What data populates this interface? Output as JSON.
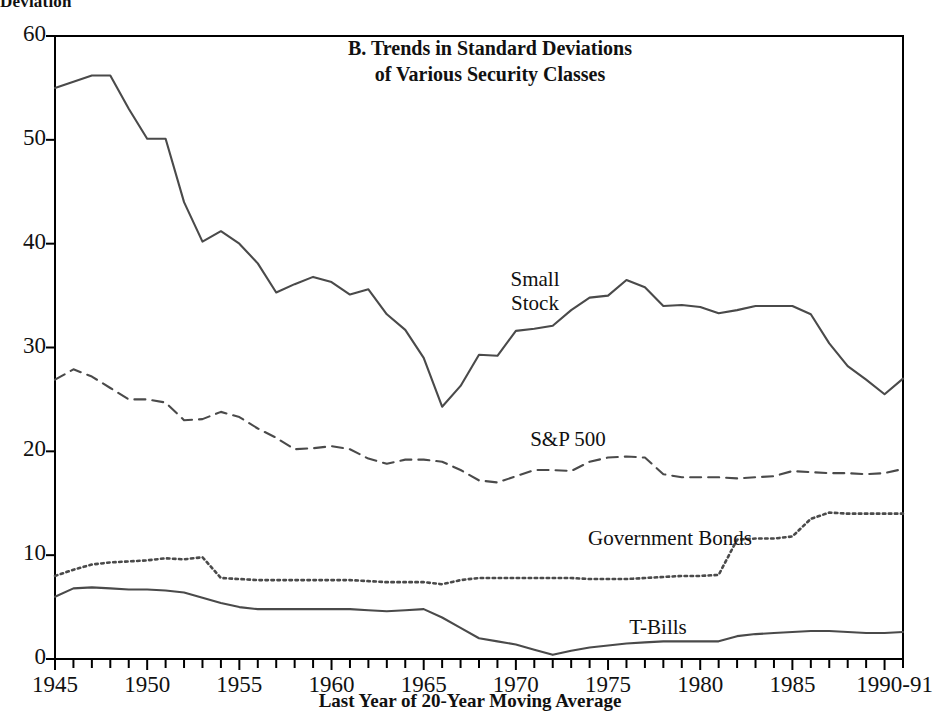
{
  "axis_title_top": "Deviation",
  "title_line1": "B. Trends in Standard Deviations",
  "title_line2": "of Various Security Classes",
  "xaxis_title": "Last Year of 20-Year Moving Average",
  "series_labels": {
    "small_stock": "Small\nStock",
    "sp500": "S&P 500",
    "gov_bonds": "Government Bonds",
    "tbills": "T-Bills"
  },
  "chart_data": {
    "type": "line",
    "title": "B. Trends in Standard Deviations of Various Security Classes",
    "subtitle": "",
    "xlabel": "Last Year of 20-Year Moving Average",
    "ylabel": "Deviation",
    "xlim": [
      1945,
      1991
    ],
    "ylim": [
      0,
      60
    ],
    "yticks": [
      0,
      10,
      20,
      30,
      40,
      50,
      60
    ],
    "ytick_labels": [
      "0",
      "10",
      "20",
      "30",
      "40",
      "50",
      "60"
    ],
    "xticks": [
      1945,
      1950,
      1955,
      1960,
      1965,
      1970,
      1975,
      1980,
      1985,
      1990
    ],
    "xtick_labels": [
      "1945",
      "1950",
      "1955",
      "1960",
      "1965",
      "1970",
      "1975",
      "1980",
      "1985",
      "1990-91"
    ],
    "grid": false,
    "legend": "inline-annotations",
    "x": [
      1945,
      1946,
      1947,
      1948,
      1949,
      1950,
      1951,
      1952,
      1953,
      1954,
      1955,
      1956,
      1957,
      1958,
      1959,
      1960,
      1961,
      1962,
      1963,
      1964,
      1965,
      1966,
      1967,
      1968,
      1969,
      1970,
      1971,
      1972,
      1973,
      1974,
      1975,
      1976,
      1977,
      1978,
      1979,
      1980,
      1981,
      1982,
      1983,
      1984,
      1985,
      1986,
      1987,
      1988,
      1989,
      1990,
      1991
    ],
    "series": [
      {
        "name": "Small Stock",
        "linestyle": "solid",
        "color": "#4a4a4a",
        "values": [
          55.0,
          55.6,
          56.2,
          56.2,
          53.0,
          50.1,
          50.1,
          44.0,
          40.2,
          41.2,
          40.0,
          38.1,
          35.3,
          36.1,
          36.8,
          36.3,
          35.1,
          35.6,
          33.2,
          31.7,
          29.0,
          24.3,
          26.3,
          29.3,
          29.2,
          31.6,
          31.8,
          32.1,
          33.6,
          34.8,
          35.0,
          36.5,
          35.8,
          34.0,
          34.1,
          33.9,
          33.3,
          33.6,
          34.0,
          34.0,
          34.0,
          33.2,
          30.4,
          28.2,
          26.9,
          25.5,
          27.0
        ]
      },
      {
        "name": "S&P 500",
        "linestyle": "dashed",
        "color": "#4a4a4a",
        "values": [
          26.9,
          27.9,
          27.2,
          26.1,
          25.0,
          25.0,
          24.7,
          23.0,
          23.1,
          23.8,
          23.3,
          22.2,
          21.3,
          20.2,
          20.3,
          20.5,
          20.2,
          19.3,
          18.8,
          19.2,
          19.2,
          19.0,
          18.2,
          17.2,
          17.0,
          17.6,
          18.2,
          18.2,
          18.1,
          19.0,
          19.4,
          19.5,
          19.4,
          17.8,
          17.5,
          17.5,
          17.5,
          17.4,
          17.5,
          17.6,
          18.1,
          18.0,
          17.9,
          17.9,
          17.8,
          17.9,
          18.3
        ]
      },
      {
        "name": "Government Bonds",
        "linestyle": "dotted",
        "color": "#4a4a4a",
        "values": [
          8.0,
          8.6,
          9.1,
          9.3,
          9.4,
          9.5,
          9.7,
          9.6,
          9.8,
          7.8,
          7.7,
          7.6,
          7.6,
          7.6,
          7.6,
          7.6,
          7.6,
          7.5,
          7.4,
          7.4,
          7.4,
          7.2,
          7.6,
          7.8,
          7.8,
          7.8,
          7.8,
          7.8,
          7.8,
          7.7,
          7.7,
          7.7,
          7.8,
          7.9,
          8.0,
          8.0,
          8.1,
          11.5,
          11.6,
          11.6,
          11.8,
          13.5,
          14.1,
          14.0,
          14.0,
          14.0,
          14.0
        ]
      },
      {
        "name": "T-Bills",
        "linestyle": "solid",
        "color": "#4a4a4a",
        "values": [
          6.0,
          6.8,
          6.9,
          6.8,
          6.7,
          6.7,
          6.6,
          6.4,
          5.9,
          5.4,
          5.0,
          4.8,
          4.8,
          4.8,
          4.8,
          4.8,
          4.8,
          4.7,
          4.6,
          4.7,
          4.8,
          4.0,
          3.0,
          2.0,
          1.7,
          1.4,
          0.9,
          0.4,
          0.8,
          1.1,
          1.3,
          1.5,
          1.6,
          1.7,
          1.7,
          1.7,
          1.7,
          2.2,
          2.4,
          2.5,
          2.6,
          2.7,
          2.7,
          2.6,
          2.5,
          2.5,
          2.6
        ]
      }
    ]
  }
}
